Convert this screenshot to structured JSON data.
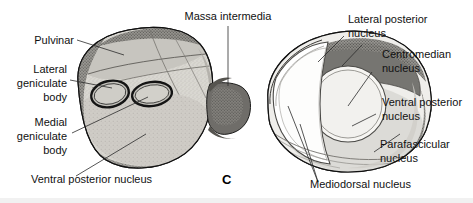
{
  "figure": {
    "panel_letter": "C",
    "caption_subject": "thalamus-nuclei-diagram",
    "background_color": "#ffffff",
    "ink_color": "#111111"
  },
  "labels": {
    "left": [
      {
        "id": "pulvinar",
        "text": "Pulvinar",
        "align": "right"
      },
      {
        "id": "lateral-geniculate-body",
        "line1": "Lateral",
        "line2": "geniculate",
        "line3": "body",
        "align": "right"
      },
      {
        "id": "medial-geniculate-body",
        "line1": "Medial",
        "line2": "geniculate",
        "line3": "body",
        "align": "right"
      },
      {
        "id": "ventral-posterior-nucleus-left",
        "text": "Ventral posterior nucleus",
        "align": "left"
      }
    ],
    "top": [
      {
        "id": "massa-intermedia",
        "text": "Massa intermedia",
        "align": "middle"
      }
    ],
    "right": [
      {
        "id": "lateral-posterior-nucleus",
        "line1": "Lateral posterior",
        "line2": "nucleus",
        "align": "left"
      },
      {
        "id": "centromedian-nucleus",
        "line1": "Centromedian",
        "line2": "nucleus",
        "align": "left"
      },
      {
        "id": "ventral-posterior-nucleus-right",
        "line1": "Ventral posterior",
        "line2": "nucleus",
        "align": "left"
      },
      {
        "id": "parafascicular-nucleus",
        "line1": "Parafascicular",
        "line2": "nucleus",
        "align": "left"
      }
    ],
    "bottom": [
      {
        "id": "mediodorsal-nucleus",
        "text": "Mediodorsal nucleus",
        "align": "left"
      }
    ]
  },
  "label_text": {
    "pulvinar": "Pulvinar",
    "lateral_geniculate_1": "Lateral",
    "lateral_geniculate_2": "geniculate",
    "lateral_geniculate_3": "body",
    "medial_geniculate_1": "Medial",
    "medial_geniculate_2": "geniculate",
    "medial_geniculate_3": "body",
    "ventral_posterior_left": "Ventral posterior nucleus",
    "massa_intermedia": "Massa intermedia",
    "lateral_posterior_1": "Lateral posterior",
    "lateral_posterior_2": "nucleus",
    "centromedian_1": "Centromedian",
    "centromedian_2": "nucleus",
    "ventral_posterior_right_1": "Ventral posterior",
    "ventral_posterior_right_2": "nucleus",
    "parafascicular_1": "Parafascicular",
    "parafascicular_2": "nucleus",
    "mediodorsal": "Mediodorsal nucleus",
    "panel_letter": "C"
  },
  "structures": {
    "left_thalamus": {
      "name": "left-thalamus-lateral-view",
      "fill": "#d8d6d0",
      "outline": "#1a1a1a",
      "description": "stippled three-dimensional lateral surface view"
    },
    "right_thalamus": {
      "name": "right-thalamus-cut-section",
      "fill": "#e8e7e3",
      "outline": "#1a1a1a",
      "description": "cut medial section exposing internal nuclei"
    },
    "massa_intermedia": {
      "name": "massa-intermedia-bridge",
      "fill": "#6e6c68",
      "description": "dark interthalamic adhesion connecting both halves"
    },
    "lateral_posterior": {
      "name": "lateral-posterior-nucleus-region",
      "fill": "#767571"
    },
    "centromedian": {
      "name": "centromedian-nucleus-region",
      "fill": "#f4f3f0"
    },
    "mediodorsal": {
      "name": "mediodorsal-nucleus-region",
      "fill": "#ffffff"
    },
    "ventral_posterior": {
      "name": "ventral-posterior-nucleus-region",
      "fill": "#dbdad6"
    },
    "pulvinar_region": {
      "name": "pulvinar-region",
      "fill": "#c9c7c1"
    },
    "lateral_geniculate": {
      "name": "lateral-geniculate-body-oval",
      "fill": "#c2c0ba"
    },
    "medial_geniculate": {
      "name": "medial-geniculate-body-oval",
      "fill": "#c2c0ba"
    }
  },
  "colors": {
    "ink": "#111111",
    "leader": "#2b2b2b",
    "dark_gray": "#767571",
    "mid_gray": "#b9b7b1",
    "light_gray": "#dbdad6",
    "pale": "#f1f0ed",
    "white": "#ffffff",
    "footer_band": "#f1f1f1"
  }
}
